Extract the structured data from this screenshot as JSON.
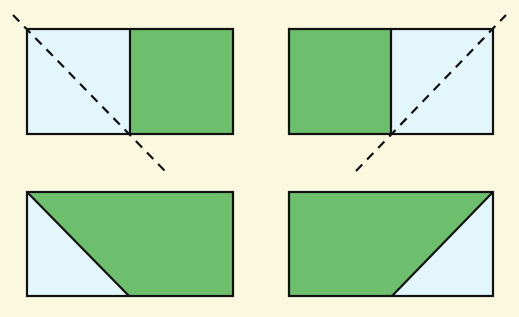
{
  "colors": {
    "background": "#fbf8e0",
    "green": "#6dbf6d",
    "light_blue": "#e3f6fb",
    "stroke": "#111111"
  },
  "figures": [
    {
      "id": "top-left",
      "rect": {
        "x": 27,
        "y": 29,
        "w": 206,
        "h": 105
      },
      "regions": [
        {
          "name": "left-half",
          "fill": "light_blue",
          "points": [
            [
              27,
              29
            ],
            [
              130,
              29
            ],
            [
              130,
              134
            ],
            [
              27,
              134
            ]
          ]
        },
        {
          "name": "right-half",
          "fill": "green",
          "points": [
            [
              130,
              29
            ],
            [
              233,
              29
            ],
            [
              233,
              134
            ],
            [
              130,
              134
            ]
          ]
        }
      ],
      "solid_lines": [
        [
          [
            130,
            29
          ],
          [
            130,
            134
          ]
        ]
      ],
      "dashed_lines": [
        [
          [
            13,
            15
          ],
          [
            165,
            171
          ]
        ]
      ]
    },
    {
      "id": "top-right",
      "rect": {
        "x": 289,
        "y": 29,
        "w": 204,
        "h": 105
      },
      "regions": [
        {
          "name": "left-half",
          "fill": "green",
          "points": [
            [
              289,
              29
            ],
            [
              391,
              29
            ],
            [
              391,
              134
            ],
            [
              289,
              134
            ]
          ]
        },
        {
          "name": "right-half",
          "fill": "light_blue",
          "points": [
            [
              391,
              29
            ],
            [
              493,
              29
            ],
            [
              493,
              134
            ],
            [
              391,
              134
            ]
          ]
        }
      ],
      "solid_lines": [
        [
          [
            391,
            29
          ],
          [
            391,
            134
          ]
        ]
      ],
      "dashed_lines": [
        [
          [
            356,
            171
          ],
          [
            506,
            15
          ]
        ]
      ]
    },
    {
      "id": "bottom-left",
      "rect": {
        "x": 27,
        "y": 192,
        "w": 206,
        "h": 104
      },
      "regions": [
        {
          "name": "triangle",
          "fill": "light_blue",
          "points": [
            [
              27,
              192
            ],
            [
              129,
              296
            ],
            [
              27,
              296
            ]
          ]
        },
        {
          "name": "trapezoid",
          "fill": "green",
          "points": [
            [
              27,
              192
            ],
            [
              233,
              192
            ],
            [
              233,
              296
            ],
            [
              129,
              296
            ]
          ]
        }
      ],
      "solid_lines": [
        [
          [
            27,
            192
          ],
          [
            129,
            296
          ]
        ]
      ],
      "dashed_lines": []
    },
    {
      "id": "bottom-right",
      "rect": {
        "x": 289,
        "y": 192,
        "w": 204,
        "h": 104
      },
      "regions": [
        {
          "name": "trapezoid",
          "fill": "green",
          "points": [
            [
              289,
              192
            ],
            [
              493,
              192
            ],
            [
              392,
              296
            ],
            [
              289,
              296
            ]
          ]
        },
        {
          "name": "triangle",
          "fill": "light_blue",
          "points": [
            [
              493,
              192
            ],
            [
              493,
              296
            ],
            [
              392,
              296
            ]
          ]
        }
      ],
      "solid_lines": [
        [
          [
            493,
            192
          ],
          [
            392,
            296
          ]
        ]
      ],
      "dashed_lines": []
    }
  ]
}
